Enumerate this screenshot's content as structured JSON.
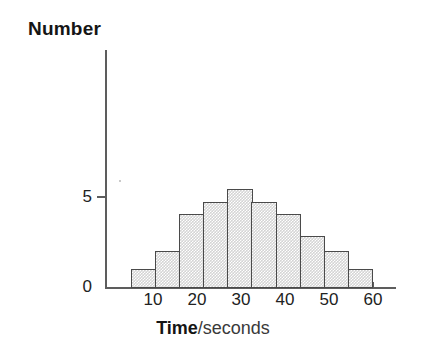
{
  "chart_data": {
    "type": "bar",
    "title": "",
    "subtitle": "",
    "xlabel": "Time/seconds",
    "xlabel_bold": "Time",
    "xlabel_rest": "/seconds",
    "ylabel": "Number",
    "categories": [
      "5-10",
      "10-15",
      "15-20",
      "20-25",
      "25-30",
      "30-35",
      "35-40",
      "40-45",
      "45-50",
      "50-55"
    ],
    "bin_edges": [
      5,
      10,
      15,
      20,
      25,
      30,
      35,
      40,
      45,
      50,
      55
    ],
    "values": [
      1,
      2,
      4,
      4.7,
      5.4,
      4.7,
      4,
      2.8,
      2,
      1
    ],
    "xlim": [
      5,
      60
    ],
    "ylim": [
      0,
      8.1
    ],
    "x_ticks": [
      10,
      20,
      30,
      40,
      50,
      60
    ],
    "x_tick_labels": [
      "10",
      "20",
      "30",
      "40",
      "50",
      "60"
    ],
    "x_minor_ticks": [
      5,
      15,
      25,
      35,
      45,
      55
    ],
    "y_ticks": [
      0,
      5
    ],
    "y_tick_labels": [
      "0",
      "5"
    ],
    "grid": false,
    "legend": null,
    "legend_position": "none",
    "bar_fill_color": "#d4d4d4",
    "bar_edge_color": "#4a4a4a",
    "axis_color": "#5d5d5d",
    "text_color": "#151515",
    "background_color": "#ffffff"
  },
  "axes": {
    "y_title": "Number",
    "y_tick_labels": [
      "5",
      "0"
    ],
    "x_tick_labels": [
      "10",
      "20",
      "30",
      "40",
      "50",
      "60"
    ],
    "x_title_bold": "Time",
    "x_title_rest": "/seconds"
  }
}
